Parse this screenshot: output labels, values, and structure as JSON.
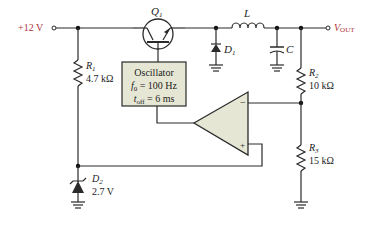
{
  "colors": {
    "wire": "#2a2a2a",
    "block_fill": "#e6e6d4",
    "label_accent": "#b0343a"
  },
  "supply": {
    "label": "+12 V"
  },
  "output": {
    "label_main": "V",
    "label_sub": "OUT"
  },
  "transistor": {
    "name": "Q",
    "sub": "1"
  },
  "inductor": {
    "name": "L"
  },
  "capacitor": {
    "name": "C"
  },
  "diode1": {
    "name": "D",
    "sub": "1"
  },
  "r1": {
    "name": "R",
    "sub": "1",
    "value": "4.7 kΩ"
  },
  "r2": {
    "name": "R",
    "sub": "2",
    "value": "10 kΩ"
  },
  "r3": {
    "name": "R",
    "sub": "3",
    "value": "15 kΩ"
  },
  "zener": {
    "name": "D",
    "sub": "2",
    "value": "2.7 V"
  },
  "oscillator": {
    "title": "Oscillator",
    "line1_sym": "f",
    "line1_sub": "0",
    "line1_val": " = 100 Hz",
    "line2_sym": "t",
    "line2_sub": "off",
    "line2_val": " = 6 ms"
  },
  "opamp": {
    "inv": "−",
    "noninv": "+"
  }
}
